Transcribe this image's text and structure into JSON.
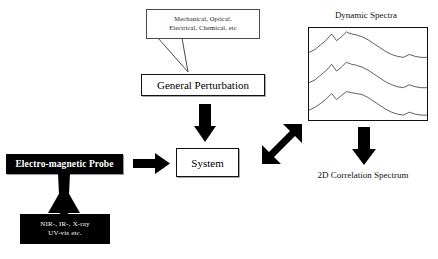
{
  "diagram": {
    "perturbation_sources": {
      "line1": "Mechanical, Optical,",
      "line2": "Electrical, Chemical, etc"
    },
    "general_perturbation": "General Perturbation",
    "system": "System",
    "probe": "Electro-magnetic Probe",
    "probe_sources": {
      "line1": "NIR-, IR-, X-ray",
      "line2": "UV-vis etc."
    },
    "spectra_title": "Dynamic Spectra",
    "correlation_label": "2D Correlation Spectrum",
    "colors": {
      "ink": "#000000",
      "paper": "#ffffff",
      "trace": "#333333"
    }
  },
  "chart_data": {
    "type": "line",
    "title": "Dynamic Spectra",
    "xlabel": "",
    "ylabel": "",
    "grid": false,
    "legend": "none",
    "axis_visible": false,
    "xlim": [
      0,
      120
    ],
    "ylim": [
      0,
      94
    ],
    "series": [
      {
        "name": "trace-top",
        "x": [
          0,
          6,
          12,
          18,
          23,
          28,
          33,
          38,
          43,
          48,
          54,
          60,
          66,
          72,
          78,
          84,
          90,
          96,
          102,
          108,
          114,
          120
        ],
        "y": [
          25,
          22,
          17,
          12,
          6,
          13,
          9,
          4,
          6,
          7,
          9,
          12,
          16,
          20,
          24,
          27,
          29,
          30,
          27,
          29,
          30,
          30
        ]
      },
      {
        "name": "trace-middle",
        "x": [
          0,
          6,
          12,
          18,
          23,
          28,
          33,
          38,
          43,
          48,
          54,
          60,
          66,
          72,
          78,
          84,
          90,
          96,
          102,
          108,
          114,
          120
        ],
        "y": [
          56,
          53,
          48,
          43,
          37,
          44,
          40,
          35,
          37,
          38,
          40,
          43,
          47,
          51,
          55,
          58,
          60,
          61,
          58,
          60,
          61,
          61
        ]
      },
      {
        "name": "trace-bottom",
        "x": [
          0,
          6,
          12,
          18,
          23,
          28,
          33,
          38,
          43,
          48,
          54,
          60,
          66,
          72,
          78,
          84,
          90,
          96,
          102,
          108,
          114,
          120
        ],
        "y": [
          84,
          81,
          77,
          72,
          67,
          73,
          69,
          65,
          66,
          67,
          68,
          71,
          75,
          79,
          83,
          86,
          88,
          89,
          86,
          88,
          89,
          89
        ]
      }
    ]
  }
}
